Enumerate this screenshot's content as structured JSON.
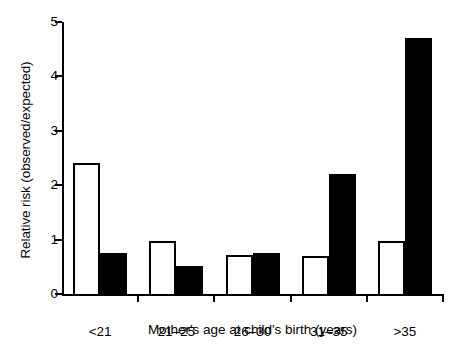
{
  "chart_data": {
    "type": "bar",
    "title": "",
    "xlabel": "Mother's age at child's birth (years)",
    "ylabel": "Relative risk (observed/expected)",
    "categories": [
      "<21",
      "21–25",
      "26–30",
      "31–35",
      ">35"
    ],
    "series": [
      {
        "name": "open",
        "style": "open-outlined-white",
        "color": "#ffffff",
        "edgecolor": "#000000",
        "values": [
          2.4,
          0.97,
          0.72,
          0.7,
          0.97
        ]
      },
      {
        "name": "filled",
        "style": "solid-black",
        "color": "#000000",
        "edgecolor": "#000000",
        "values": [
          0.75,
          0.52,
          0.75,
          2.2,
          4.7
        ]
      }
    ],
    "ylim": [
      0,
      5
    ],
    "yticks": [
      0,
      1,
      2,
      3,
      4,
      5
    ],
    "yticklabels": [
      "0",
      "1",
      "2",
      "3",
      "4",
      "5"
    ],
    "grid": false,
    "legend": "none",
    "legend_position": "none",
    "reference_line": null
  },
  "axes": {
    "y_tick_labels": [
      "0",
      "1",
      "2",
      "3",
      "4",
      "5"
    ],
    "x_tick_labels": [
      "<21",
      "21–25",
      "26–30",
      "31–35",
      ">35"
    ]
  },
  "colors": {
    "ink": "#000000",
    "paper": "#ffffff",
    "bar_open_fill": "#ffffff",
    "bar_filled_fill": "#000000"
  }
}
